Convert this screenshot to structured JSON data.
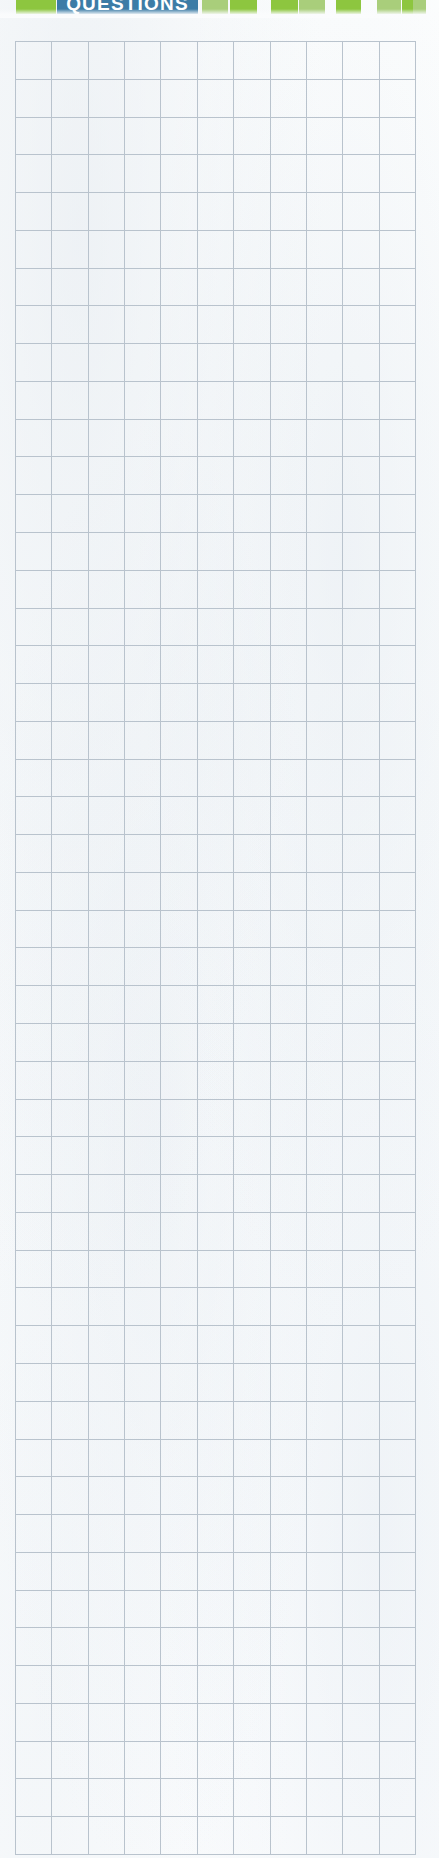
{
  "page": {
    "width": 439,
    "height": 1858,
    "background_color": "#fbfcfd",
    "kind": "worksheet-grid-page"
  },
  "banner": {
    "title": "QUESTIONS",
    "title_color": "#ffffff",
    "banner_color": "#3c7ca6",
    "green_dark": "#8dc63f",
    "green_light": "#a9ce7b",
    "strip_height": 14,
    "blocks": [
      {
        "name": "green-block-1",
        "type": "green-dark",
        "x": 16,
        "width": 40
      },
      {
        "name": "title-banner",
        "type": "banner",
        "x": 57,
        "width": 141
      },
      {
        "name": "green-block-2",
        "type": "green-light",
        "x": 202,
        "width": 26
      },
      {
        "name": "green-block-3",
        "type": "green-dark",
        "x": 230,
        "width": 27
      },
      {
        "name": "green-block-4",
        "type": "green-dark",
        "x": 271,
        "width": 27
      },
      {
        "name": "green-block-5",
        "type": "green-light",
        "x": 299,
        "width": 26
      },
      {
        "name": "green-block-6",
        "type": "green-dark",
        "x": 336,
        "width": 25
      },
      {
        "name": "green-block-7",
        "type": "green-light",
        "x": 377,
        "width": 24
      },
      {
        "name": "green-block-8",
        "type": "green-dark",
        "x": 402,
        "width": 24
      },
      {
        "name": "green-block-9",
        "type": "green-light",
        "x": 413,
        "width": 13
      }
    ]
  },
  "grid": {
    "columns": 11,
    "rows": 48,
    "left": 15,
    "top": 41,
    "right": 416,
    "bottom": 1855,
    "cell_width": 36.5,
    "cell_height": 37.8,
    "line_color": "#b9c3cd",
    "cell_fill": "transparent",
    "cells": []
  }
}
